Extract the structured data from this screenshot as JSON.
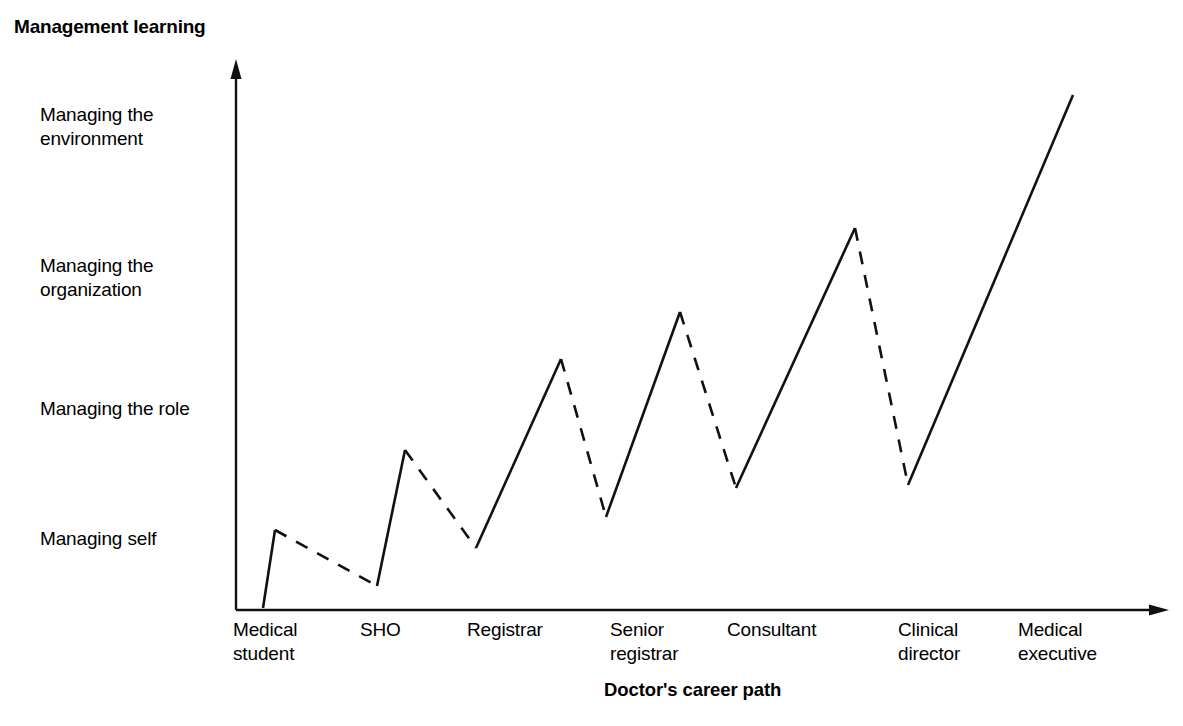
{
  "title": "Management learning",
  "xaxis_title": "Doctor's career path",
  "y_categories": [
    "Managing the\nenvironment",
    "Managing the\norganization",
    "Managing the role",
    "Managing self"
  ],
  "x_categories": [
    "Medical\nstudent",
    "SHO",
    "Registrar",
    "Senior\nregistrar",
    "Consultant",
    "Clinical\ndirector",
    "Medical\nexecutive"
  ],
  "colors": {
    "line": "#111111",
    "axis": "#111111",
    "background": "#ffffff",
    "text": "#000000"
  },
  "chart_data": {
    "type": "line",
    "title": "Management learning",
    "xlabel": "Doctor's career path",
    "ylabel": "Management learning",
    "grid": false,
    "legend": null,
    "axis_style": "arrow-headed open axes (no tick marks, no numeric scale)",
    "x_categories": [
      "Medical student",
      "SHO",
      "Registrar",
      "Senior registrar",
      "Consultant",
      "Clinical director",
      "Medical executive"
    ],
    "y_categories": [
      "Managing self",
      "Managing the role",
      "Managing the organization",
      "Managing the environment"
    ],
    "y_category_levels": {
      "Managing self": 1,
      "Managing the role": 2,
      "Managing the organization": 3,
      "Managing the environment": 4
    },
    "series": [
      {
        "name": "Management learning trajectory",
        "vertices": [
          {
            "index": 0,
            "x": 263,
            "y": 608,
            "stage": "Medical student",
            "level_value": 0.0,
            "kind": "start"
          },
          {
            "index": 1,
            "x": 275,
            "y": 530,
            "stage": "Medical student",
            "level_value": 0.98,
            "kind": "peak"
          },
          {
            "index": 2,
            "x": 377,
            "y": 586,
            "stage": "SHO",
            "level_value": 0.28,
            "kind": "trough"
          },
          {
            "index": 3,
            "x": 405,
            "y": 450,
            "stage": "SHO",
            "level_value": 1.99,
            "kind": "peak"
          },
          {
            "index": 4,
            "x": 476,
            "y": 548,
            "stage": "Registrar",
            "level_value": 0.76,
            "kind": "trough"
          },
          {
            "index": 5,
            "x": 561,
            "y": 359,
            "stage": "Registrar",
            "level_value": 3.13,
            "kind": "peak"
          },
          {
            "index": 6,
            "x": 606,
            "y": 517,
            "stage": "Senior registrar",
            "level_value": 1.15,
            "kind": "trough"
          },
          {
            "index": 7,
            "x": 680,
            "y": 312,
            "stage": "Senior registrar",
            "level_value": 3.72,
            "kind": "peak"
          },
          {
            "index": 8,
            "x": 736,
            "y": 488,
            "stage": "Consultant",
            "level_value": 1.51,
            "kind": "trough"
          },
          {
            "index": 9,
            "x": 855,
            "y": 228,
            "stage": "Consultant",
            "level_value": 4.78,
            "kind": "peak"
          },
          {
            "index": 10,
            "x": 908,
            "y": 485,
            "stage": "Clinical director",
            "level_value": 1.55,
            "kind": "trough"
          },
          {
            "index": 11,
            "x": 1073,
            "y": 95,
            "stage": "Medical executive",
            "level_value": 6.45,
            "kind": "end"
          }
        ],
        "segments": [
          {
            "from": 0,
            "to": 1,
            "style": "solid",
            "direction": "rise"
          },
          {
            "from": 1,
            "to": 2,
            "style": "dashed",
            "direction": "fall"
          },
          {
            "from": 2,
            "to": 3,
            "style": "solid",
            "direction": "rise"
          },
          {
            "from": 3,
            "to": 4,
            "style": "dashed",
            "direction": "fall"
          },
          {
            "from": 4,
            "to": 5,
            "style": "solid",
            "direction": "rise"
          },
          {
            "from": 5,
            "to": 6,
            "style": "dashed",
            "direction": "fall"
          },
          {
            "from": 6,
            "to": 7,
            "style": "solid",
            "direction": "rise"
          },
          {
            "from": 7,
            "to": 8,
            "style": "dashed",
            "direction": "fall"
          },
          {
            "from": 8,
            "to": 9,
            "style": "solid",
            "direction": "rise"
          },
          {
            "from": 9,
            "to": 10,
            "style": "dashed",
            "direction": "fall"
          },
          {
            "from": 10,
            "to": 11,
            "style": "solid",
            "direction": "rise"
          }
        ]
      }
    ],
    "axes": {
      "y_axis": {
        "x": 236,
        "y_top": 62,
        "y_bottom": 610,
        "arrow": "up"
      },
      "x_axis": {
        "y": 610,
        "x_left": 236,
        "x_right": 1168,
        "arrow": "right"
      }
    }
  }
}
